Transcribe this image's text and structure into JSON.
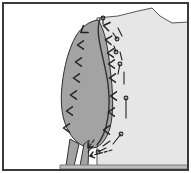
{
  "figure": {
    "title": "",
    "caption": "",
    "width": 191,
    "height": 173,
    "background_color": "#ffffff",
    "frame": {
      "stroke_color": "#3a3a3a",
      "stroke_width": 2,
      "x": 3,
      "y": 3,
      "w": 185,
      "h": 167
    }
  },
  "chart_data": {
    "type": "diagram",
    "title": "",
    "xlabel": "",
    "ylabel": "",
    "colors": {
      "lobe_fill": "#a3a3a3",
      "body_fill": "#e6e6e6",
      "outline": "#2f2f2f",
      "marker": "#222222",
      "background": "#ffffff",
      "frame": "#3a3a3a"
    },
    "regions": [
      {
        "name": "pale-body-region",
        "fill": "#e6e6e6",
        "stroke": "#555555",
        "label": "",
        "path": "M 97 18 L 118 16 L 138 11 L 152 8 L 160 16 L 172 23 L 188 22 L 188 168 L 97 168 Z"
      },
      {
        "name": "dark-lobe-region",
        "fill": "#a3a3a3",
        "stroke": "#2f2f2f",
        "label": "",
        "path": "M 98 20 C 90 21 82 26 76 36 C 69 48 64 66 62 86 C 60 104 62 120 69 132 C 74 141 82 147 90 148 C 99 149 106 141 110 128 C 114 112 113 90 110 68 C 108 48 105 30 98 20 Z"
      },
      {
        "name": "stem-left-segment",
        "fill": "#a3a3a3",
        "stroke": "#2f2f2f",
        "label": "",
        "path": "M 70 139 L 66 166 L 74 166 L 79 144 Z"
      },
      {
        "name": "stem-right-segment",
        "fill": "#a3a3a3",
        "stroke": "#2f2f2f",
        "label": "",
        "path": "M 84 144 L 80 166 L 88 166 L 89 140 Z"
      },
      {
        "name": "ground-baseline",
        "fill": "#bdbdbd",
        "stroke": "#777777",
        "label": "",
        "path": "M 60 165 L 188 165 L 188 169 L 60 169 Z"
      }
    ],
    "boundary_curve": {
      "name": "lobe-boundary",
      "stroke": "#2f2f2f",
      "path": "M 100 19 C 94 34 105 60 108 84 C 111 108 108 132 97 145"
    },
    "chevrons": [
      {
        "id": "c1",
        "x": 83,
        "y": 31,
        "rotation": -35,
        "group": "lobe-interior"
      },
      {
        "id": "c2",
        "x": 80,
        "y": 45,
        "rotation": 0,
        "group": "lobe-interior"
      },
      {
        "id": "c3",
        "x": 78,
        "y": 62,
        "rotation": 0,
        "group": "lobe-interior"
      },
      {
        "id": "c4",
        "x": 76,
        "y": 78,
        "rotation": 0,
        "group": "lobe-interior"
      },
      {
        "id": "c5",
        "x": 73,
        "y": 95,
        "rotation": 0,
        "group": "lobe-interior"
      },
      {
        "id": "c6",
        "x": 69,
        "y": 111,
        "rotation": 0,
        "group": "lobe-interior"
      },
      {
        "id": "c7",
        "x": 66,
        "y": 128,
        "rotation": 0,
        "group": "lobe-interior"
      },
      {
        "id": "c8",
        "x": 106,
        "y": 26,
        "rotation": 10,
        "group": "boundary-zone"
      },
      {
        "id": "c9",
        "x": 108,
        "y": 40,
        "rotation": 5,
        "group": "boundary-zone"
      },
      {
        "id": "c10",
        "x": 110,
        "y": 53,
        "rotation": 0,
        "group": "boundary-zone"
      },
      {
        "id": "c11",
        "x": 111,
        "y": 64,
        "rotation": 0,
        "group": "boundary-zone"
      },
      {
        "id": "c12",
        "x": 112,
        "y": 78,
        "rotation": 0,
        "group": "boundary-zone"
      },
      {
        "id": "c13",
        "x": 113,
        "y": 96,
        "rotation": 0,
        "group": "boundary-zone"
      },
      {
        "id": "c14",
        "x": 111,
        "y": 112,
        "rotation": 0,
        "group": "boundary-zone"
      },
      {
        "id": "c15",
        "x": 106,
        "y": 130,
        "rotation": 0,
        "group": "boundary-zone"
      }
    ],
    "pin_markers": [
      {
        "id": "p1",
        "head_x": 103,
        "head_y": 18,
        "tail_x": 103,
        "tail_y": 24,
        "group": "boundary-pins"
      },
      {
        "id": "p2",
        "head_x": 117,
        "head_y": 39,
        "tail_x": 113,
        "tail_y": 33,
        "group": "boundary-pins"
      },
      {
        "id": "p3",
        "head_x": 116,
        "head_y": 52,
        "tail_x": 114,
        "tail_y": 46,
        "group": "boundary-pins"
      },
      {
        "id": "p4",
        "head_x": 120,
        "head_y": 64,
        "tail_x": 118,
        "tail_y": 74,
        "group": "boundary-pins"
      },
      {
        "id": "p5",
        "head_x": 126,
        "head_y": 98,
        "tail_x": 126,
        "tail_y": 118,
        "group": "boundary-pins"
      },
      {
        "id": "p6",
        "head_x": 121,
        "head_y": 134,
        "tail_x": 113,
        "tail_y": 144,
        "group": "boundary-pins"
      },
      {
        "id": "p7",
        "head_x": 98,
        "head_y": 152,
        "tail_x": 106,
        "tail_y": 148,
        "group": "boundary-pins"
      }
    ],
    "tick_marks": [
      {
        "id": "t1",
        "x1": 118,
        "y1": 28,
        "x2": 122,
        "y2": 36,
        "group": "short-strokes"
      },
      {
        "id": "t2",
        "x1": 120,
        "y1": 52,
        "x2": 122,
        "y2": 60,
        "group": "short-strokes"
      },
      {
        "id": "t3",
        "x1": 124,
        "y1": 72,
        "x2": 124,
        "y2": 84,
        "group": "short-strokes"
      },
      {
        "id": "t4",
        "x1": 110,
        "y1": 141,
        "x2": 103,
        "y2": 146,
        "group": "short-strokes"
      },
      {
        "id": "t5",
        "x1": 93,
        "y1": 146,
        "x2": 88,
        "y2": 152,
        "group": "short-strokes"
      }
    ],
    "arrows": [
      {
        "id": "a1",
        "x1": 112,
        "y1": 150,
        "x2": 90,
        "y2": 156,
        "label": "",
        "group": "stem-arrow"
      },
      {
        "id": "a2",
        "x1": 94,
        "y1": 140,
        "x2": 88,
        "y2": 148,
        "label": "",
        "group": "stem-arrow"
      }
    ],
    "legend": [],
    "annotations": []
  }
}
